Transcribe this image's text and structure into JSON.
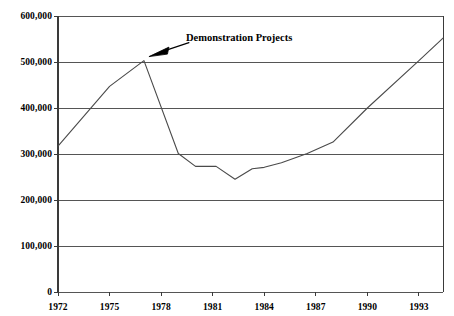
{
  "chart_data": {
    "type": "line",
    "title": "",
    "subtitle": "",
    "xlabel": "",
    "ylabel": "",
    "xlim": [
      1972,
      1994.4
    ],
    "ylim": [
      0,
      600000
    ],
    "grid": true,
    "legend_position": "none",
    "x_tick_labels": [
      "1972",
      "1975",
      "1978",
      "1981",
      "1984",
      "1987",
      "1990",
      "1993"
    ],
    "x_tick_values": [
      1972,
      1975,
      1978,
      1981,
      1984,
      1987,
      1990,
      1993
    ],
    "y_tick_labels": [
      "0",
      "100,000",
      "200,000",
      "300,000",
      "400,000",
      "500,000",
      "600,000"
    ],
    "y_tick_values": [
      0,
      100000,
      200000,
      300000,
      400000,
      500000,
      600000
    ],
    "series": [
      {
        "name": "",
        "x": [
          1972,
          1975,
          1977,
          1979,
          1980,
          1981.2,
          1982.3,
          1983.3,
          1984,
          1985,
          1986.5,
          1988,
          1990,
          1993,
          1994.4
        ],
        "values": [
          317000,
          447000,
          503000,
          301000,
          273000,
          273000,
          245000,
          268000,
          271000,
          281000,
          301000,
          326000,
          400000,
          503000,
          552000
        ]
      }
    ],
    "annotations": [
      {
        "text": "Demonstration Projects",
        "arrow": "arrow-pointing-down-left",
        "target_x": 1977.0,
        "target_y": 503000
      }
    ]
  },
  "axis": {
    "tick_marks": "outward",
    "line_color": "#3a3a3a",
    "grid_color": "#555555",
    "series_color": "#4a4a4a"
  }
}
